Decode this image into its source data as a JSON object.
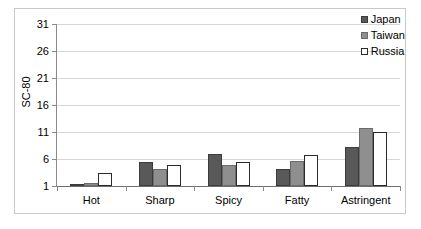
{
  "chart_data": {
    "type": "bar",
    "title": "",
    "xlabel": "",
    "ylabel": "SC-80",
    "categories": [
      "Hot",
      "Sharp",
      "Spicy",
      "Fatty",
      "Astringent"
    ],
    "series": [
      {
        "name": "Japan",
        "color": "#595959",
        "values": [
          1.1,
          5.4,
          6.9,
          4.1,
          8.2
        ]
      },
      {
        "name": "Taiwan",
        "color": "#8f8f8f",
        "values": [
          1.6,
          4.2,
          4.8,
          5.7,
          11.8
        ]
      },
      {
        "name": "Russia",
        "color": "#ffffff",
        "values": [
          3.5,
          4.9,
          5.5,
          6.7,
          11.0
        ]
      }
    ],
    "ylim": [
      1,
      31
    ],
    "yticks": [
      1,
      6,
      11,
      16,
      21,
      26,
      31
    ],
    "ytick_labels": [
      "1",
      "6",
      "11",
      "16",
      "21",
      "26",
      "31"
    ],
    "grid": true,
    "legend_position": "top-right",
    "legend_entries": [
      "Japan",
      "Taiwan",
      "Russia"
    ]
  }
}
